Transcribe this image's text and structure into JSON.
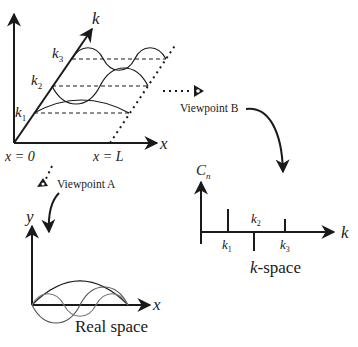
{
  "diagram": {
    "top_panel": {
      "axis_x_label": "x",
      "axis_k_label": "k",
      "origin_label": "x = 0",
      "end_label": "x = L",
      "k_labels": [
        {
          "base": "k",
          "sub": "1"
        },
        {
          "base": "k",
          "sub": "2"
        },
        {
          "base": "k",
          "sub": "3"
        }
      ]
    },
    "viewpoint_a": {
      "label": "Viewpoint A"
    },
    "viewpoint_b": {
      "label": "Viewpoint B"
    },
    "real_space": {
      "axis_y_label": "y",
      "axis_x_label": "x",
      "caption": "Real space"
    },
    "k_space": {
      "axis_y_label": {
        "base": "C",
        "sub": "n"
      },
      "axis_x_label": "k",
      "tick_labels": [
        {
          "base": "k",
          "sub": "1"
        },
        {
          "base": "k",
          "sub": "2"
        },
        {
          "base": "k",
          "sub": "3"
        }
      ],
      "caption_italic": "k",
      "caption_rest": "-space"
    },
    "colors": {
      "ink": "#1a1a1a",
      "background": "#ffffff"
    }
  }
}
